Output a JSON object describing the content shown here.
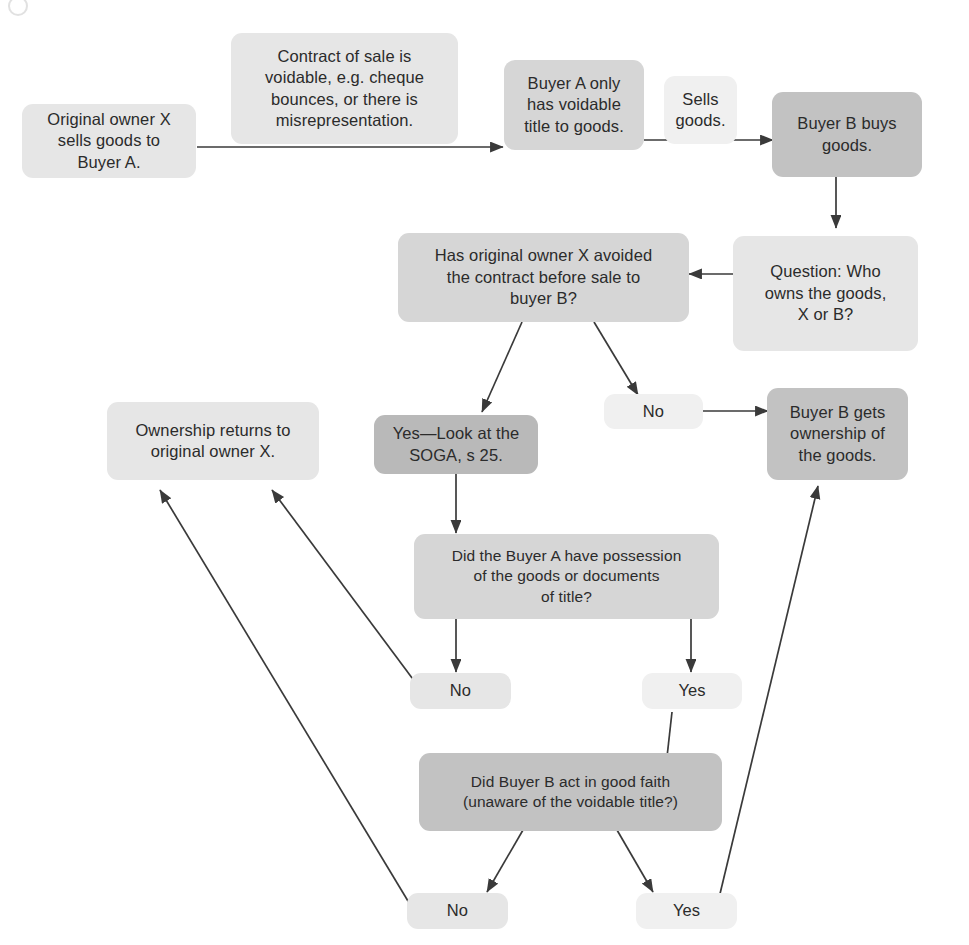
{
  "diagram": {
    "type": "flowchart",
    "colors": {
      "background": "#ffffff",
      "edge": "#3a3a3a",
      "text": "#2b2b2b",
      "shade_lightest": "#f0f0f0",
      "shade_light": "#e6e6e6",
      "shade_mid": "#d6d6d6",
      "shade_dark": "#c2c2c2",
      "shade_darkest": "#b9b9b9"
    },
    "nodes": [
      {
        "id": "n1",
        "label": "Original owner X\nsells goods to\nBuyer A."
      },
      {
        "id": "n2",
        "label": "Contract of sale is\nvoidable, e.g. cheque\nbounces, or there is\nmisrepresentation."
      },
      {
        "id": "n3",
        "label": "Buyer A only\nhas voidable\ntitle to goods."
      },
      {
        "id": "n4",
        "label": "Sells\ngoods."
      },
      {
        "id": "n5",
        "label": "Buyer B buys\ngoods."
      },
      {
        "id": "n6",
        "label": "Question: Who\nowns the goods,\nX or B?"
      },
      {
        "id": "n7",
        "label": "Has original owner X avoided\nthe contract before sale to\nbuyer B?"
      },
      {
        "id": "n8",
        "label": "Yes—Look at the\nSOGA, s 25."
      },
      {
        "id": "n9",
        "label": "No"
      },
      {
        "id": "n10",
        "label": "Buyer B gets\nownership of\nthe goods."
      },
      {
        "id": "n11",
        "label": "Ownership returns to\noriginal owner X."
      },
      {
        "id": "n12",
        "label": "Did the Buyer A have possession\nof the goods or documents\nof title?"
      },
      {
        "id": "n13",
        "label": "No"
      },
      {
        "id": "n14",
        "label": "Yes"
      },
      {
        "id": "n15",
        "label": "Did Buyer B act in good faith\n(unaware of the voidable title?)"
      },
      {
        "id": "n16",
        "label": "No"
      },
      {
        "id": "n17",
        "label": "Yes"
      }
    ],
    "edges": [
      {
        "from": "n1",
        "to": "n3",
        "label": ""
      },
      {
        "from": "n3",
        "to": "n5",
        "label": ""
      },
      {
        "from": "n5",
        "to": "n6",
        "label": ""
      },
      {
        "from": "n6",
        "to": "n7",
        "label": ""
      },
      {
        "from": "n7",
        "to": "n8",
        "label": "Yes"
      },
      {
        "from": "n7",
        "to": "n9",
        "label": "No"
      },
      {
        "from": "n9",
        "to": "n10",
        "label": ""
      },
      {
        "from": "n8",
        "to": "n12",
        "label": ""
      },
      {
        "from": "n12",
        "to": "n13",
        "label": "No"
      },
      {
        "from": "n12",
        "to": "n14",
        "label": "Yes"
      },
      {
        "from": "n13",
        "to": "n11",
        "label": ""
      },
      {
        "from": "n14",
        "to": "n15",
        "label": ""
      },
      {
        "from": "n15",
        "to": "n16",
        "label": "No"
      },
      {
        "from": "n15",
        "to": "n17",
        "label": "Yes"
      },
      {
        "from": "n16",
        "to": "n11",
        "label": ""
      },
      {
        "from": "n17",
        "to": "n10",
        "label": ""
      }
    ]
  }
}
